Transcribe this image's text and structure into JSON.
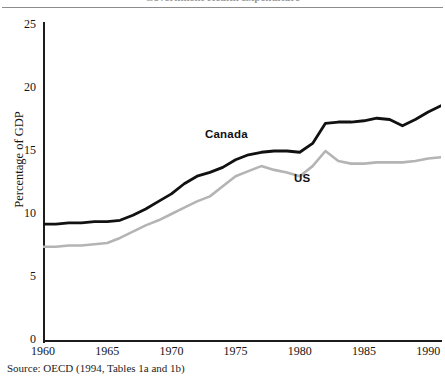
{
  "figure": {
    "cut_title": "Government Health Expenditure",
    "source_note": "Source: OECD (1994, Tables 1a and 1b)"
  },
  "labels": {
    "canada": "Canada",
    "us": "US"
  },
  "chart_data": {
    "type": "line",
    "title": "",
    "xlabel": "",
    "ylabel": "Percentage of GDP",
    "xlim": [
      1960,
      1991
    ],
    "ylim": [
      0,
      25
    ],
    "yticks": [
      0,
      5,
      10,
      15,
      20,
      25
    ],
    "ytick_labels": [
      "0",
      "5",
      "10",
      "15",
      "20",
      "25"
    ],
    "xticks": [
      1960,
      1965,
      1970,
      1975,
      1980,
      1985,
      1990
    ],
    "xtick_labels": [
      "1960",
      "1965",
      "1970",
      "1975",
      "1980",
      "1985",
      "1990"
    ],
    "grid": false,
    "legend": "inline-annotations",
    "x": [
      1960,
      1961,
      1962,
      1963,
      1964,
      1965,
      1966,
      1967,
      1968,
      1969,
      1970,
      1971,
      1972,
      1973,
      1974,
      1975,
      1976,
      1977,
      1978,
      1979,
      1980,
      1981,
      1982,
      1983,
      1984,
      1985,
      1986,
      1987,
      1988,
      1989,
      1990,
      1991
    ],
    "series": [
      {
        "name": "Canada",
        "color": "#111111",
        "values": [
          9.2,
          9.2,
          9.3,
          9.3,
          9.4,
          9.4,
          9.5,
          9.9,
          10.4,
          11.0,
          11.6,
          12.4,
          13.0,
          13.3,
          13.7,
          14.3,
          14.7,
          14.9,
          15.0,
          15.0,
          14.9,
          15.6,
          17.2,
          17.3,
          17.3,
          17.4,
          17.6,
          17.5,
          17.0,
          17.5,
          18.1,
          18.6
        ]
      },
      {
        "name": "US",
        "color": "#b4b4b4",
        "values": [
          7.4,
          7.4,
          7.5,
          7.5,
          7.6,
          7.7,
          8.1,
          8.6,
          9.1,
          9.5,
          10.0,
          10.5,
          11.0,
          11.4,
          12.2,
          13.0,
          13.4,
          13.8,
          13.5,
          13.3,
          13.0,
          13.8,
          15.0,
          14.2,
          14.0,
          14.0,
          14.1,
          14.1,
          14.1,
          14.2,
          14.4,
          14.5
        ]
      }
    ]
  }
}
